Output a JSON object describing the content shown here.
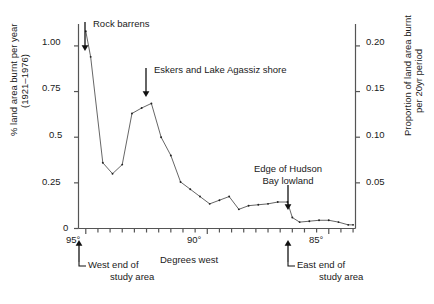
{
  "chart_data": {
    "type": "line",
    "title": "",
    "xlabel": "Degrees west",
    "ylabel": "% land area burnt per year (1921–1976)",
    "ylabel_right": "Proportion of land area burnt per 20yr period",
    "xlim": [
      95.3,
      83.9
    ],
    "ylim": [
      0,
      1.12
    ],
    "ylim_right": [
      0,
      0.224
    ],
    "grid": false,
    "legend": "none",
    "x_tick_labels": [
      "95°",
      "90°",
      "85°"
    ],
    "x_tick_values": [
      95,
      90,
      85
    ],
    "x_minor_tick_values": [
      95,
      94.5,
      94,
      93.5,
      93,
      92.5,
      92,
      91.5,
      91,
      90.5,
      90,
      89.5,
      89,
      88.5,
      88,
      87.5,
      87,
      86.5,
      86,
      85.5,
      85,
      84.5,
      84
    ],
    "y_tick_labels": [
      "0",
      "0.25",
      "0.5",
      "0.75",
      "1.00"
    ],
    "y_tick_values": [
      0,
      0.25,
      0.5,
      0.75,
      1.0
    ],
    "y_right_tick_labels": [
      "0.05",
      "0.10",
      "0.15",
      "0.20"
    ],
    "y_right_tick_values": [
      0.05,
      0.1,
      0.15,
      0.2
    ],
    "series": [
      {
        "name": "% land area burnt per year",
        "x": [
          95.0,
          94.8,
          94.3,
          93.9,
          93.5,
          93.1,
          92.7,
          92.3,
          91.9,
          91.5,
          91.1,
          90.7,
          90.3,
          89.9,
          89.5,
          89.1,
          88.7,
          88.3,
          87.9,
          87.5,
          87.1,
          86.7,
          86.5,
          86.2,
          85.8,
          85.4,
          85.0,
          84.6,
          84.2,
          84.0
        ],
        "y": [
          1.08,
          0.94,
          0.36,
          0.3,
          0.35,
          0.63,
          0.66,
          0.685,
          0.5,
          0.4,
          0.255,
          0.215,
          0.175,
          0.135,
          0.155,
          0.175,
          0.105,
          0.125,
          0.13,
          0.135,
          0.145,
          0.145,
          0.06,
          0.035,
          0.04,
          0.045,
          0.045,
          0.035,
          0.02,
          0.02
        ]
      }
    ],
    "annotations": [
      {
        "label": "Rock barrens",
        "x": 94.8,
        "y": 0.94
      },
      {
        "label": "Eskers and Lake Agassiz shore",
        "x": 92.3,
        "y": 0.685
      },
      {
        "label": "Edge of Hudson\nBay lowland",
        "x": 86.6,
        "y": 0.145
      }
    ],
    "axis_annotations": [
      {
        "label": "West end of\nstudy area",
        "x": 95.0
      },
      {
        "label": "East end of\nstudy area",
        "x": 86.6
      }
    ],
    "line_color": "#555555",
    "marker_color": "#222222",
    "axis_color": "#555555",
    "text_color": "#1a1a1a"
  },
  "labels": {
    "ylabel_left_line1": "% land area burnt per year",
    "ylabel_left_line2": "(1921–1976)",
    "ylabel_right_line1": "Proportion of land area burnt",
    "ylabel_right_line2": "per 20yr period",
    "xlabel": "Degrees west",
    "ytick_1": "1.00",
    "ytick_2": "0.75",
    "ytick_3": "0.5",
    "ytick_4": "0.25",
    "ytick_5": "0",
    "ytick_r1": "0.20",
    "ytick_r2": "0.15",
    "ytick_r3": "0.10",
    "ytick_r4": "0.05",
    "xtick_1": "95°",
    "xtick_2": "90°",
    "xtick_3": "85°",
    "ann_rock_barrens": "Rock barrens",
    "ann_eskers": "Eskers and Lake Agassiz shore",
    "ann_hudson_line1": "Edge of Hudson",
    "ann_hudson_line2": "Bay lowland",
    "ann_west_line1": "West end of",
    "ann_west_line2": "study area",
    "ann_east_line1": "East end of",
    "ann_east_line2": "study area"
  }
}
